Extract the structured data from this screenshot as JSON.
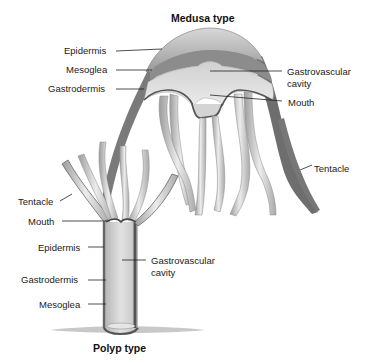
{
  "medusa": {
    "title": "Medusa type",
    "labels": {
      "epidermis": "Epidermis",
      "mesoglea": "Mesoglea",
      "gastrodermis": "Gastrodermis",
      "gastrovascular_line1": "Gastrovascular",
      "gastrovascular_line2": "cavity",
      "mouth": "Mouth",
      "tentacle": "Tentacle"
    }
  },
  "polyp": {
    "title": "Polyp type",
    "labels": {
      "tentacle": "Tentacle",
      "mouth": "Mouth",
      "epidermis": "Epidermis",
      "gastrovascular_line1": "Gastrovascular",
      "gastrovascular_line2": "cavity",
      "gastrodermis": "Gastrodermis",
      "mesoglea": "Mesoglea"
    }
  },
  "colors": {
    "epidermis": "#8a8a8a",
    "mesoglea": "#c8c8c8",
    "gastrodermis": "#5a5a5a",
    "cavity": "#e4e4e4",
    "background": "#ffffff"
  }
}
